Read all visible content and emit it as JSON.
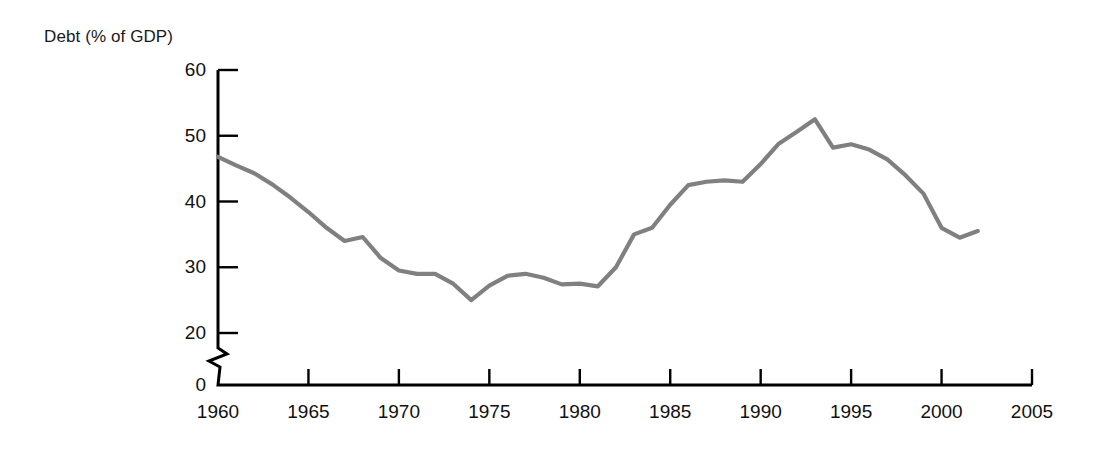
{
  "chart_data": {
    "type": "line",
    "title": "",
    "ylabel": "Debt (% of GDP)",
    "xlabel": "",
    "xlim": [
      1960,
      2005
    ],
    "ylim": [
      0,
      60
    ],
    "y_axis_break": true,
    "y_axis_break_range": [
      0,
      20
    ],
    "grid": false,
    "legend": null,
    "series_color": "#808080",
    "axis_color": "#000000",
    "xticks": [
      1960,
      1965,
      1970,
      1975,
      1980,
      1985,
      1990,
      1995,
      2000,
      2005
    ],
    "xtick_labels": [
      "1960",
      "1965",
      "1970",
      "1975",
      "1980",
      "1985",
      "1990",
      "1995",
      "2000",
      "2005"
    ],
    "yticks": [
      0,
      20,
      30,
      40,
      50,
      60
    ],
    "ytick_labels": [
      "0",
      "20",
      "30",
      "40",
      "50",
      "60"
    ],
    "x": [
      1960,
      1961,
      1962,
      1963,
      1964,
      1965,
      1966,
      1967,
      1968,
      1969,
      1970,
      1971,
      1972,
      1973,
      1974,
      1975,
      1976,
      1977,
      1978,
      1979,
      1980,
      1981,
      1982,
      1983,
      1984,
      1985,
      1986,
      1987,
      1988,
      1989,
      1990,
      1991,
      1992,
      1993,
      1994,
      1995,
      1996,
      1997,
      1998,
      1999,
      2000,
      2001,
      2002
    ],
    "values": [
      46.8,
      45.5,
      44.3,
      42.6,
      40.6,
      38.4,
      36.0,
      34.0,
      34.6,
      31.4,
      29.5,
      29.0,
      29.0,
      27.5,
      25.0,
      27.2,
      28.7,
      29.0,
      28.4,
      27.4,
      27.5,
      27.1,
      30.0,
      35.0,
      36.0,
      39.5,
      42.5,
      43.0,
      43.2,
      43.0,
      45.7,
      48.8,
      50.6,
      52.5,
      48.2,
      48.7,
      47.9,
      46.4,
      44.0,
      41.2,
      36.0,
      34.5,
      35.5
    ]
  },
  "axis_title_text": "Debt (% of GDP)"
}
